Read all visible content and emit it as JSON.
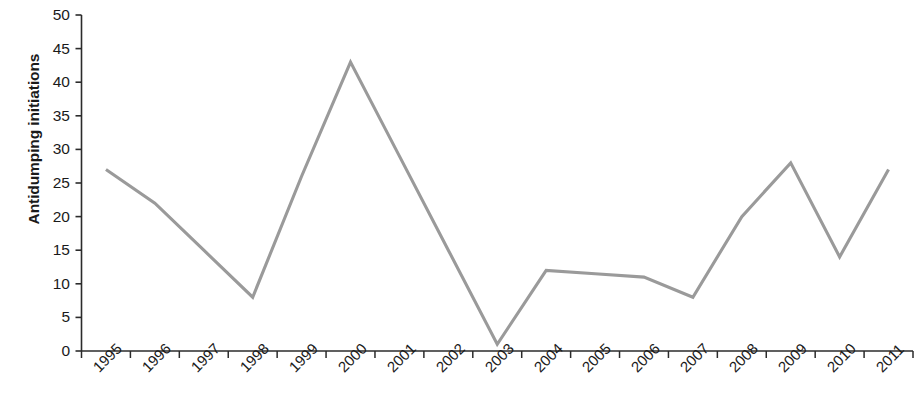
{
  "chart_data": {
    "type": "line",
    "title": "",
    "xlabel": "",
    "ylabel": "Antidumping initiations",
    "categories": [
      "1995",
      "1996",
      "1997",
      "1998",
      "1999",
      "2000",
      "2001",
      "2002",
      "2003",
      "2004",
      "2005",
      "2006",
      "2007",
      "2008",
      "2009",
      "2010",
      "2011"
    ],
    "values": [
      27,
      22,
      15,
      8,
      26,
      43,
      29,
      15,
      1,
      12,
      11.5,
      11,
      8,
      20,
      28,
      14,
      27
    ],
    "series": [
      {
        "name": "Antidumping initiations",
        "values": [
          27,
          22,
          15,
          8,
          26,
          43,
          29,
          15,
          1,
          12,
          11.5,
          11,
          8,
          20,
          28,
          14,
          27
        ]
      }
    ],
    "ylim": [
      0,
      50
    ],
    "ytick_values": [
      0,
      5,
      10,
      15,
      20,
      25,
      30,
      35,
      40,
      45,
      50
    ],
    "ytick_labels": [
      "0",
      "5",
      "10",
      "15",
      "20",
      "25",
      "30",
      "35",
      "40",
      "45",
      "50"
    ],
    "grid": false,
    "legend": false,
    "legend_position": "none",
    "line_color": "#9a9a9a",
    "axis_color": "#2b2b2b",
    "text_color": "#1a1a1a",
    "xtick_label_rotation": -45
  }
}
